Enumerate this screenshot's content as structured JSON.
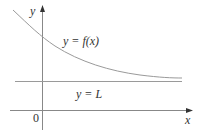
{
  "figure": {
    "curve_label": "y = f(x)",
    "asymptote_label": "y = L",
    "x_axis_label": "x",
    "y_axis_label": "y",
    "origin_label": "0",
    "colors": {
      "curve": "#9a9a9a",
      "asymptote": "#9a9a9a",
      "axes": "#888888",
      "text": "#333333"
    }
  }
}
